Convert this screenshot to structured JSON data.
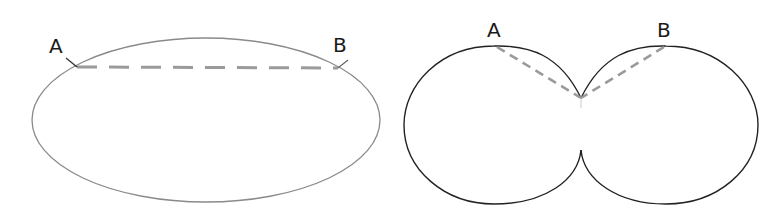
{
  "figures": [
    {
      "name": "ellipse",
      "points": [
        {
          "label": "A"
        },
        {
          "label": "B"
        }
      ],
      "chord_style": "dashed"
    },
    {
      "name": "cardioid-lobes",
      "points": [
        {
          "label": "A"
        },
        {
          "label": "B"
        }
      ],
      "chord_style": "dashed"
    }
  ],
  "colors": {
    "outline_left": "#8a8a8a",
    "outline_right": "#222222",
    "dashed_line": "#9a9a9a",
    "label": "#1a1a1a"
  }
}
